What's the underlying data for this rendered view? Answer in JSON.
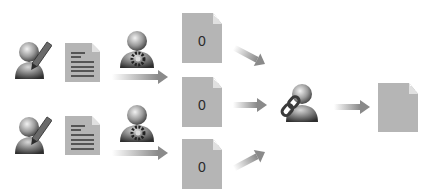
{
  "diagram": {
    "rows": [
      {
        "author_icon": "user-pencil-icon",
        "document_icon": "text-document-icon",
        "reviewer_icon": "user-gear-icon"
      },
      {
        "author_icon": "user-pencil-icon",
        "document_icon": "text-document-icon",
        "reviewer_icon": "user-gear-icon"
      }
    ],
    "intermediate_docs": [
      {
        "label": "0"
      },
      {
        "label": "0"
      },
      {
        "label": "0"
      }
    ],
    "merger_icon": "user-link-icon",
    "output_doc": {
      "label": ""
    },
    "colors": {
      "doc_fill": "#b5b5b5",
      "arrow": "#8a8a8a",
      "icon_dark": "#3a3a3a",
      "background": "#ffffff"
    }
  }
}
